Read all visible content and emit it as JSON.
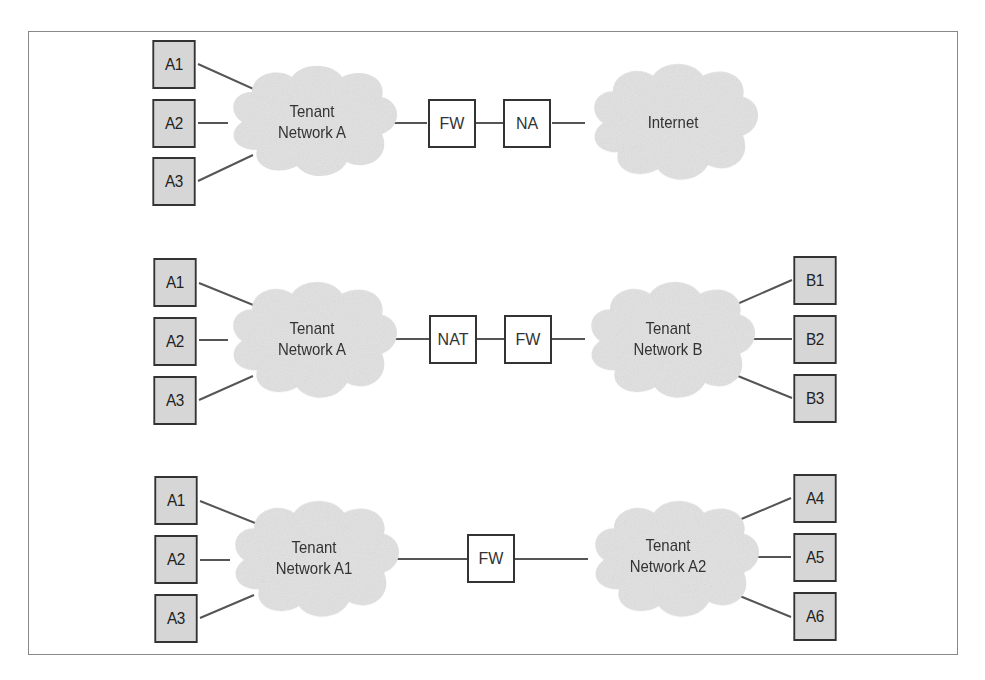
{
  "colors": {
    "host_fill": "#d6d6d6",
    "cloud_fill": "#e3e3e3",
    "line": "#444444",
    "border": "#888888"
  },
  "row1": {
    "hosts": [
      "A1",
      "A2",
      "A3"
    ],
    "cloud_left": [
      "Tenant",
      "Network A"
    ],
    "devices": [
      "FW",
      "NA"
    ],
    "cloud_right": [
      "Internet"
    ]
  },
  "row2": {
    "hosts_left": [
      "A1",
      "A2",
      "A3"
    ],
    "cloud_left": [
      "Tenant",
      "Network A"
    ],
    "devices": [
      "NAT",
      "FW"
    ],
    "cloud_right": [
      "Tenant",
      "Network B"
    ],
    "hosts_right": [
      "B1",
      "B2",
      "B3"
    ]
  },
  "row3": {
    "hosts_left": [
      "A1",
      "A2",
      "A3"
    ],
    "cloud_left": [
      "Tenant",
      "Network A1"
    ],
    "devices": [
      "FW"
    ],
    "cloud_right": [
      "Tenant",
      "Network A2"
    ],
    "hosts_right": [
      "A4",
      "A5",
      "A6"
    ]
  }
}
